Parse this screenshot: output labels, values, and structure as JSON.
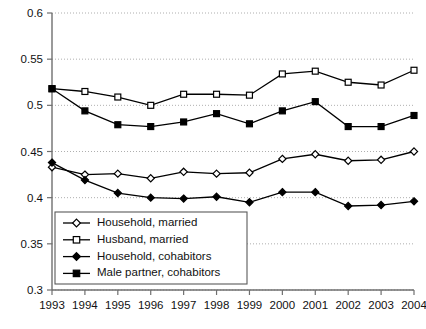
{
  "chart_data": {
    "type": "line",
    "title": "",
    "subtitle": "",
    "xlabel": "",
    "ylabel": "",
    "x": [
      1993,
      1994,
      1995,
      1996,
      1997,
      1998,
      1999,
      2000,
      2001,
      2002,
      2003,
      2004
    ],
    "categories": [
      "1993",
      "1994",
      "1995",
      "1996",
      "1997",
      "1998",
      "1999",
      "2000",
      "2001",
      "2002",
      "2003",
      "2004"
    ],
    "xlim": [
      1993,
      2004
    ],
    "ylim": [
      0.3,
      0.6
    ],
    "yticks": [
      0.3,
      0.35,
      0.4,
      0.45,
      0.5,
      0.55,
      0.6
    ],
    "ytick_labels": [
      "0.3",
      "0.35",
      "0.4",
      "0.45",
      "0.5",
      "0.55",
      "0.6"
    ],
    "grid": true,
    "grid_axis": "y",
    "legend_position": "lower-left-inside",
    "series": [
      {
        "name": "Household, married",
        "marker": "open-diamond",
        "values": [
          0.433,
          0.425,
          0.426,
          0.421,
          0.428,
          0.426,
          0.427,
          0.442,
          0.447,
          0.44,
          0.441,
          0.45
        ]
      },
      {
        "name": "Husband, married",
        "marker": "open-square",
        "values": [
          0.518,
          0.515,
          0.509,
          0.5,
          0.512,
          0.512,
          0.511,
          0.534,
          0.537,
          0.525,
          0.522,
          0.538
        ]
      },
      {
        "name": "Household, cohabitors",
        "marker": "filled-diamond",
        "values": [
          0.438,
          0.419,
          0.405,
          0.4,
          0.399,
          0.401,
          0.395,
          0.406,
          0.406,
          0.391,
          0.392,
          0.396
        ]
      },
      {
        "name": "Male partner, cohabitors",
        "marker": "filled-square",
        "values": [
          0.518,
          0.494,
          0.479,
          0.477,
          0.482,
          0.491,
          0.48,
          0.494,
          0.504,
          0.477,
          0.477,
          0.489
        ]
      }
    ]
  },
  "colors": {
    "series_stroke": "#000000",
    "gridline": "#9a9a9a",
    "axis": "#6f6f6f",
    "background": "#ffffff",
    "text": "#111111"
  },
  "legend": {
    "items": [
      {
        "label": "Household, married",
        "marker": "open-diamond"
      },
      {
        "label": "Husband, married",
        "marker": "open-square"
      },
      {
        "label": "Household, cohabitors",
        "marker": "filled-diamond"
      },
      {
        "label": "Male partner, cohabitors",
        "marker": "filled-square"
      }
    ]
  }
}
